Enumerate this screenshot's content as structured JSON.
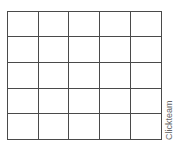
{
  "grid": {
    "rows": 5,
    "cols": 5,
    "line_color": "#4a4a4a",
    "background": "#ffffff",
    "x_lines": [
      0,
      31,
      61,
      92,
      123,
      154
    ],
    "y_lines": [
      0,
      25,
      51,
      77,
      102,
      128
    ]
  },
  "watermark": {
    "text": "Clickteam"
  }
}
